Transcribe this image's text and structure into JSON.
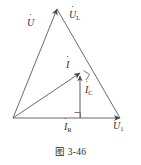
{
  "figure": {
    "caption": "图 3-46",
    "background_color": "#ffffff",
    "stroke_color": "#6b6b6b",
    "text_color": "#2b2b2b",
    "labels": {
      "source_voltage": {
        "symbol": "U",
        "subscript": "",
        "overdot": true
      },
      "inductor_voltage": {
        "symbol": "U",
        "subscript": "L",
        "overdot": true
      },
      "total_current": {
        "symbol": "I",
        "subscript": "",
        "overdot": true
      },
      "capacitor_current": {
        "symbol": "I",
        "subscript": "C",
        "overdot": true
      },
      "resistor_current": {
        "symbol": "I",
        "subscript": "R",
        "overdot": true
      },
      "output_voltage": {
        "symbol": "U",
        "subscript": "1",
        "overdot": true
      }
    },
    "geometry": {
      "origin": [
        13,
        118
      ],
      "apex": [
        57,
        9
      ],
      "right_vertex": [
        120,
        118
      ],
      "current_tip": [
        80,
        72
      ],
      "baseline_foot": [
        80,
        118
      ],
      "right_angle_markers": [
        {
          "name": "right-angle-at-current-tip",
          "x": 80,
          "y": 72
        },
        {
          "name": "right-angle-at-baseline",
          "x": 80,
          "y": 118
        }
      ],
      "arrows": [
        {
          "name": "arrow-UL-apex",
          "to": [
            57,
            9
          ]
        },
        {
          "name": "arrow-U1-right",
          "to": [
            120,
            118
          ]
        },
        {
          "name": "arrow-I-tip",
          "to": [
            80,
            72
          ]
        },
        {
          "name": "arrow-IC-tip",
          "to": [
            80,
            74
          ]
        }
      ]
    }
  }
}
